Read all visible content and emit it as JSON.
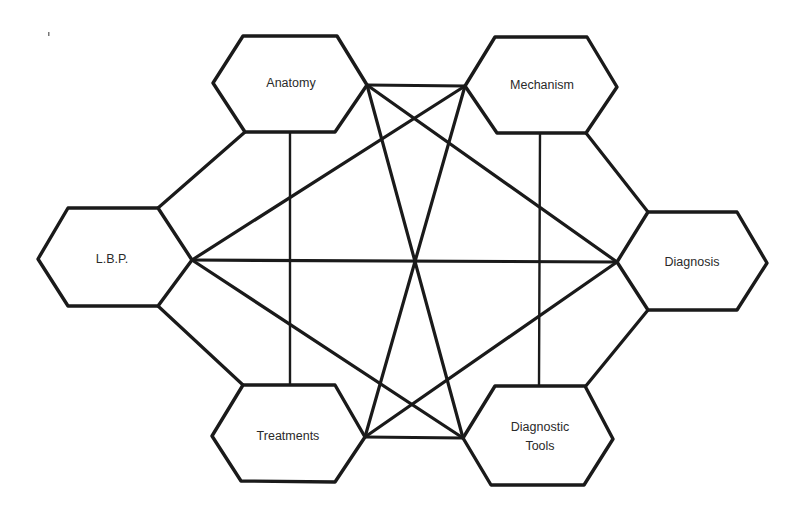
{
  "diagram": {
    "type": "hexagon-concept-network",
    "nodes": [
      {
        "id": "anatomy",
        "label": "Anatomy"
      },
      {
        "id": "mechanism",
        "label": "Mechanism"
      },
      {
        "id": "lbp",
        "label": "L.B.P."
      },
      {
        "id": "diagnosis",
        "label": "Diagnosis"
      },
      {
        "id": "treatments",
        "label": "Treatments"
      },
      {
        "id": "diagnostic_tools",
        "label_line1": "Diagnostic",
        "label_line2": "Tools"
      }
    ],
    "edges": [
      [
        "anatomy",
        "mechanism"
      ],
      [
        "anatomy",
        "lbp"
      ],
      [
        "anatomy",
        "treatments"
      ],
      [
        "anatomy",
        "diagnosis"
      ],
      [
        "anatomy",
        "diagnostic_tools"
      ],
      [
        "mechanism",
        "lbp"
      ],
      [
        "mechanism",
        "diagnosis"
      ],
      [
        "mechanism",
        "treatments"
      ],
      [
        "mechanism",
        "diagnostic_tools"
      ],
      [
        "lbp",
        "diagnosis"
      ],
      [
        "lbp",
        "treatments"
      ],
      [
        "lbp",
        "diagnostic_tools"
      ],
      [
        "diagnosis",
        "treatments"
      ],
      [
        "diagnosis",
        "diagnostic_tools"
      ],
      [
        "treatments",
        "diagnostic_tools"
      ]
    ],
    "colors": {
      "stroke": "#1a1a1a",
      "fill": "#ffffff",
      "text": "#2a2a2a"
    }
  }
}
